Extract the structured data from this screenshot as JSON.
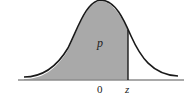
{
  "diagram": {
    "type": "normal-distribution-curve",
    "shaded_region": "left of z",
    "labels": {
      "area": "p",
      "mean": "0",
      "z": "z"
    },
    "colors": {
      "shade": "#a9a9a9",
      "curve": "#1a1a1a",
      "baseline": "#8c8c8c"
    }
  }
}
